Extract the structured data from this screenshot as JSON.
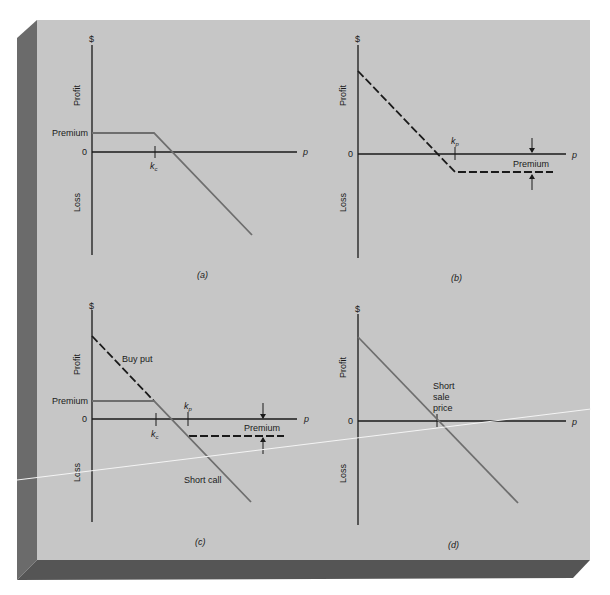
{
  "figure": {
    "colors": {
      "background": "#ffffff",
      "card_face": "#c6c6c6",
      "card_side": "#6b6b6b",
      "card_bottom": "#555555",
      "axis": "#1a1a1a",
      "solid_line": "#6e6e6e",
      "dashed_line": "#1a1a1a",
      "glare_line": "#f4f4f4"
    }
  },
  "panels": [
    {
      "id": "a",
      "caption": "(a)",
      "y_axis_top": "$",
      "profit_label": "Profit",
      "loss_label": "Loss",
      "zero_label": "0",
      "x_axis_label": "p",
      "premium_label": "Premium",
      "strike_label": "k",
      "strike_sub": "c",
      "description": "Short call payoff"
    },
    {
      "id": "b",
      "caption": "(b)",
      "y_axis_top": "$",
      "profit_label": "Profit",
      "loss_label": "Loss",
      "zero_label": "0",
      "x_axis_label": "p",
      "premium_label": "Premium",
      "strike_label": "k",
      "strike_sub": "p",
      "description": "Long put payoff"
    },
    {
      "id": "c",
      "caption": "(c)",
      "y_axis_top": "$",
      "profit_label": "Profit",
      "loss_label": "Loss",
      "zero_label": "0",
      "x_axis_label": "p",
      "premium_label_left": "Premium",
      "premium_label_right": "Premium",
      "strike_call_label": "k",
      "strike_call_sub": "c",
      "strike_put_label": "k",
      "strike_put_sub": "p",
      "buy_put_label": "Buy put",
      "short_call_label": "Short call",
      "description": "Short call plus long put (synthetic short)"
    },
    {
      "id": "d",
      "caption": "(d)",
      "y_axis_top": "$",
      "profit_label": "Profit",
      "loss_label": "Loss",
      "zero_label": "0",
      "x_axis_label": "p",
      "short_sale_label_1": "Short",
      "short_sale_label_2": "sale",
      "short_sale_label_3": "price",
      "description": "Short sale payoff"
    }
  ]
}
